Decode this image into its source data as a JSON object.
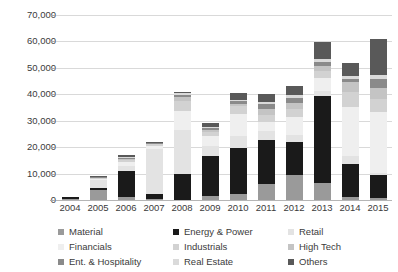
{
  "chart_data": {
    "type": "bar",
    "stacked": true,
    "title": "",
    "subtitle": "",
    "xlabel": "",
    "ylabel": "",
    "ylim": [
      0,
      70000
    ],
    "ytick_labels": [
      "0",
      "10,000",
      "20,000",
      "30,000",
      "40,000",
      "50,000",
      "60,000",
      "70,000"
    ],
    "ytick_values": [
      0,
      10000,
      20000,
      30000,
      40000,
      50000,
      60000,
      70000
    ],
    "grid": true,
    "legend_position": "bottom",
    "categories": [
      "2004",
      "2005",
      "2006",
      "2007",
      "2008",
      "2009",
      "2010",
      "2011",
      "2012",
      "2013",
      "2014",
      "2015"
    ],
    "series": [
      {
        "name": "Material",
        "color": "#9a9a9a",
        "values": [
          300,
          3800,
          1200,
          500,
          0,
          1400,
          2300,
          5900,
          9400,
          6400,
          1000,
          700
        ]
      },
      {
        "name": "Energy & Power",
        "color": "#1a1a1a",
        "values": [
          700,
          900,
          9600,
          1900,
          9900,
          15400,
          17500,
          16900,
          12400,
          32900,
          12500,
          8700
        ]
      },
      {
        "name": "Retail",
        "color": "#e3e3e3",
        "values": [
          200,
          2900,
          2200,
          16900,
          16700,
          3700,
          4600,
          3400,
          2700,
          1800,
          3100,
          1000
        ]
      },
      {
        "name": "Financials",
        "color": "#efefef",
        "values": [
          0,
          400,
          1400,
          1300,
          7200,
          3800,
          8100,
          3200,
          6900,
          4900,
          18500,
          22900
        ]
      },
      {
        "name": "Industrials",
        "color": "#d2d2d2",
        "values": [
          0,
          300,
          900,
          500,
          3800,
          1300,
          2900,
          2900,
          2900,
          2700,
          5800,
          4900
        ]
      },
      {
        "name": "High Tech",
        "color": "#c4c4c4",
        "values": [
          0,
          200,
          400,
          200,
          1500,
          900,
          1100,
          2000,
          2400,
          1900,
          3600,
          4100
        ]
      },
      {
        "name": "Ent. & Hospitality",
        "color": "#8a8a8a",
        "values": [
          0,
          150,
          300,
          150,
          800,
          600,
          800,
          2000,
          1800,
          1500,
          1300,
          3400
        ]
      },
      {
        "name": "Real Estate",
        "color": "#dadada",
        "values": [
          0,
          100,
          200,
          100,
          600,
          400,
          700,
          900,
          1300,
          1200,
          1100,
          1500
        ]
      },
      {
        "name": "Others",
        "color": "#595959",
        "values": [
          0,
          250,
          800,
          450,
          500,
          1500,
          2600,
          2800,
          3200,
          6700,
          5100,
          13800
        ]
      }
    ]
  },
  "legend": {
    "items": [
      {
        "label": "Material",
        "color": "#9a9a9a"
      },
      {
        "label": "Energy & Power",
        "color": "#1a1a1a"
      },
      {
        "label": "Retail",
        "color": "#e3e3e3"
      },
      {
        "label": "Financials",
        "color": "#efefef"
      },
      {
        "label": "Industrials",
        "color": "#d2d2d2"
      },
      {
        "label": "High Tech",
        "color": "#c4c4c4"
      },
      {
        "label": "Ent. & Hospitality",
        "color": "#8a8a8a"
      },
      {
        "label": "Real Estate",
        "color": "#dadada"
      },
      {
        "label": "Others",
        "color": "#595959"
      }
    ]
  },
  "axis": {
    "grid_color": "#d9d9d9",
    "baseline_color": "#b5b5b5",
    "text_color": "#3b3b3b"
  }
}
